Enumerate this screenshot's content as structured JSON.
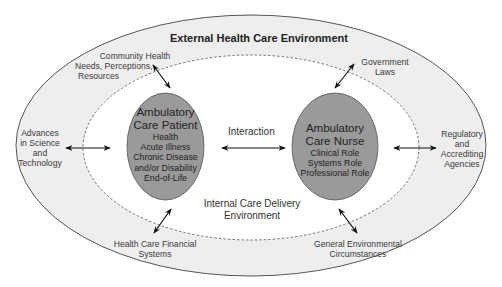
{
  "diagram": {
    "title": "External Health Care Environment",
    "inner_environment": [
      "Internal Care Delivery",
      "Environment"
    ],
    "interaction_label": "Interaction",
    "patient": {
      "title_lines": [
        "Ambulatory",
        "Care Patient"
      ],
      "items": [
        "Health",
        "Acute Illness",
        "Chronic Disease",
        "and/or Disability",
        "End-of-Life"
      ]
    },
    "nurse": {
      "title_lines": [
        "Ambulatory",
        "Care Nurse"
      ],
      "items": [
        "Clinical Role",
        "Systems Role",
        "Professional Role"
      ]
    },
    "external_factors": {
      "community": [
        "Community Health",
        "Needs, Perceptions,",
        "Resources"
      ],
      "government": [
        "Government",
        "Laws"
      ],
      "science": [
        "Advances",
        "in Science",
        "and",
        "Technology"
      ],
      "regulatory": [
        "Regulatory",
        "and",
        "Accrediting",
        "Agencies"
      ],
      "financial": [
        "Health Care Financial",
        "Systems"
      ],
      "environmental": [
        "General Environmental",
        "Circumstances"
      ]
    },
    "colors": {
      "outer_fill": "#eeeeee",
      "inner_fill": "#ffffff",
      "oval_fill": "#9a9a9a",
      "outline": "#555555",
      "arrow": "#111111"
    }
  }
}
